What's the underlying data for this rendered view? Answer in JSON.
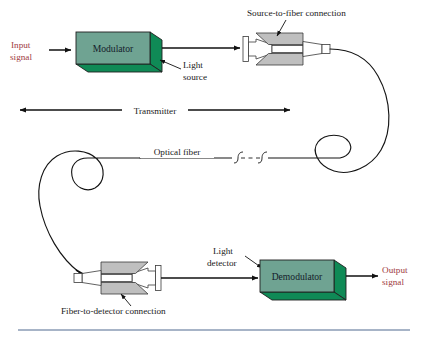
{
  "figure": {
    "bottom_rule_color": "#8a9bb4",
    "background": "#ffffff"
  },
  "colors": {
    "box_front": "#6fa392",
    "box_side": "#0f8a56",
    "box_outline": "#1f1f1f",
    "connector_gray": "#bfbfbf",
    "connector_white": "#ffffff",
    "text": "#1a1a1a",
    "signal_text": "#a03a42",
    "fiber": "#141414"
  },
  "labels": {
    "input_signal_line1": "Input",
    "input_signal_line2": "signal",
    "modulator": "Modulator",
    "light_source_line1": "Light",
    "light_source_line2": "source",
    "source_to_fiber": "Source-to-fiber connection",
    "transmitter": "Transmitter",
    "optical_fiber": "Optical fiber",
    "fiber_to_detector": "Fiber-to-detector connection",
    "light_detector_line1": "Light",
    "light_detector_line2": "detector",
    "demodulator": "Demodulator",
    "output_signal_line1": "Output",
    "output_signal_line2": "signal"
  },
  "components": [
    {
      "name": "modulator-block",
      "label": "Modulator",
      "type": "3d-block"
    },
    {
      "name": "source-to-fiber-connector",
      "label": "Source-to-fiber connection",
      "type": "connector"
    },
    {
      "name": "optical-fiber-path",
      "label": "Optical fiber",
      "type": "fiber"
    },
    {
      "name": "fiber-to-detector-connector",
      "label": "Fiber-to-detector connection",
      "type": "connector"
    },
    {
      "name": "demodulator-block",
      "label": "Demodulator",
      "type": "3d-block"
    }
  ],
  "spans": [
    {
      "name": "transmitter-span",
      "label": "Transmitter",
      "from_x": 18,
      "to_x": 290,
      "y": 110
    }
  ]
}
